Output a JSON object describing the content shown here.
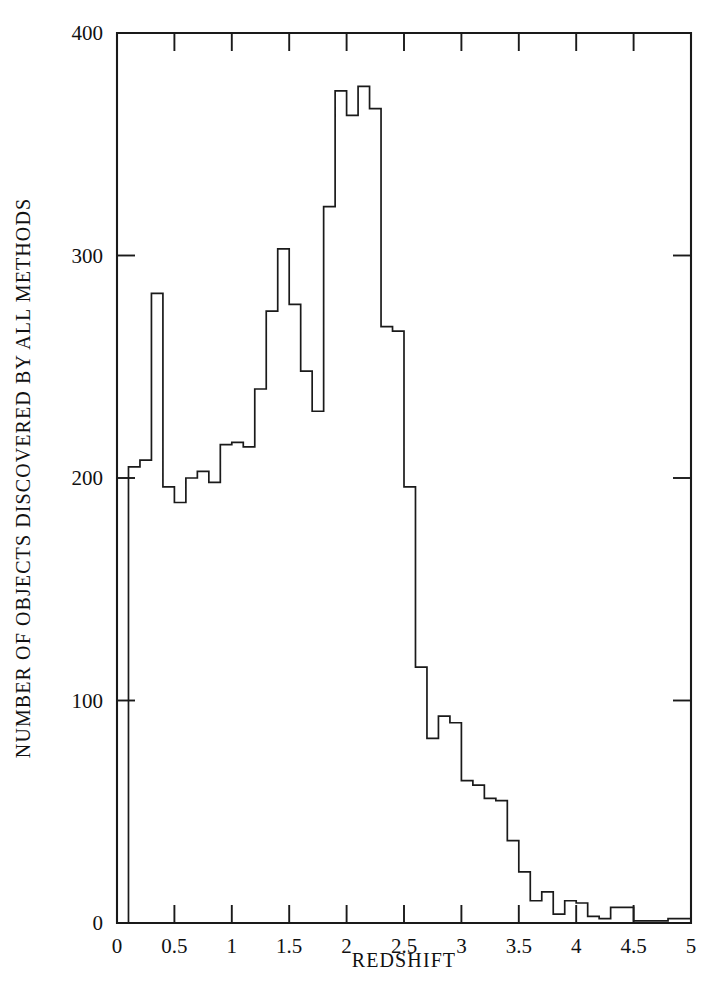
{
  "chart_data": {
    "type": "bar",
    "subtype": "histogram-step",
    "title": "",
    "xlabel": "REDSHIFT",
    "ylabel": "NUMBER OF OBJECTS DISCOVERED BY ALL METHODS",
    "xlim": [
      0,
      5
    ],
    "ylim": [
      0,
      400
    ],
    "grid": false,
    "legend": null,
    "bin_width": 0.1,
    "xticks": [
      0,
      0.5,
      1,
      1.5,
      2,
      2.5,
      3,
      3.5,
      4,
      4.5,
      5
    ],
    "xtick_labels": [
      "0",
      "0.5",
      "1",
      "1.5",
      "2",
      "2.5",
      "3",
      "3.5",
      "4",
      "4.5",
      "5"
    ],
    "yticks": [
      0,
      100,
      200,
      300,
      400
    ],
    "ytick_labels": [
      "0",
      "100",
      "200",
      "300",
      "400"
    ],
    "bin_edges": [
      0,
      0.1,
      0.2,
      0.3,
      0.4,
      0.5,
      0.6,
      0.7,
      0.8,
      0.9,
      1.0,
      1.1,
      1.2,
      1.3,
      1.4,
      1.5,
      1.6,
      1.7,
      1.8,
      1.9,
      2.0,
      2.1,
      2.2,
      2.3,
      2.4,
      2.5,
      2.6,
      2.7,
      2.8,
      2.9,
      3.0,
      3.1,
      3.2,
      3.3,
      3.4,
      3.5,
      3.6,
      3.7,
      3.8,
      3.9,
      4.0,
      4.1,
      4.2,
      4.3,
      4.4,
      4.5,
      4.6,
      4.7,
      4.8,
      4.9,
      5.0
    ],
    "bin_centers": [
      0.05,
      0.15,
      0.25,
      0.35,
      0.45,
      0.55,
      0.65,
      0.75,
      0.85,
      0.95,
      1.05,
      1.15,
      1.25,
      1.35,
      1.45,
      1.55,
      1.65,
      1.75,
      1.85,
      1.95,
      2.05,
      2.15,
      2.25,
      2.35,
      2.45,
      2.55,
      2.65,
      2.75,
      2.85,
      2.95,
      3.05,
      3.15,
      3.25,
      3.35,
      3.45,
      3.55,
      3.65,
      3.75,
      3.85,
      3.95,
      4.05,
      4.15,
      4.25,
      4.35,
      4.45,
      4.55,
      4.65,
      4.75,
      4.85,
      4.95
    ],
    "categories": [
      "0.05",
      "0.15",
      "0.25",
      "0.35",
      "0.45",
      "0.55",
      "0.65",
      "0.75",
      "0.85",
      "0.95",
      "1.05",
      "1.15",
      "1.25",
      "1.35",
      "1.45",
      "1.55",
      "1.65",
      "1.75",
      "1.85",
      "1.95",
      "2.05",
      "2.15",
      "2.25",
      "2.35",
      "2.45",
      "2.55",
      "2.65",
      "2.75",
      "2.85",
      "2.95",
      "3.05",
      "3.15",
      "3.25",
      "3.35",
      "3.45",
      "3.55",
      "3.65",
      "3.75",
      "3.85",
      "3.95",
      "4.05",
      "4.15",
      "4.25",
      "4.35",
      "4.45",
      "4.55",
      "4.65",
      "4.75",
      "4.85",
      "4.95"
    ],
    "values": [
      0,
      205,
      208,
      283,
      196,
      189,
      200,
      203,
      198,
      215,
      216,
      214,
      240,
      275,
      303,
      278,
      248,
      230,
      322,
      374,
      363,
      376,
      366,
      268,
      266,
      196,
      115,
      83,
      93,
      90,
      64,
      62,
      56,
      55,
      37,
      23,
      10,
      14,
      4,
      10,
      9,
      3,
      2,
      7,
      7,
      1,
      1,
      1,
      2,
      2
    ]
  },
  "axes": {
    "x_title": "REDSHIFT",
    "y_title": "NUMBER OF OBJECTS DISCOVERED BY ALL METHODS",
    "x_labels": [
      "0",
      "0.5",
      "1",
      "1.5",
      "2",
      "2.5",
      "3",
      "3.5",
      "4",
      "4.5",
      "5"
    ],
    "y_labels": [
      "0",
      "100",
      "200",
      "300",
      "400"
    ]
  },
  "style": {
    "line_color": "#1a1a1a",
    "background": "#ffffff"
  }
}
